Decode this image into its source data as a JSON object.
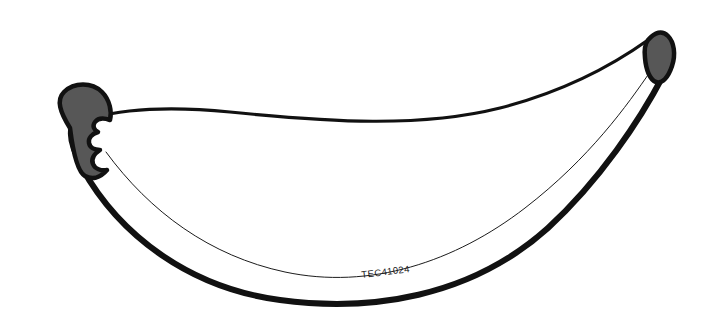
{
  "image": {
    "kind": "line-art-illustration",
    "subject": "banana",
    "title": "Banana outline drawing",
    "width": 705,
    "height": 319,
    "background_color": "#ffffff"
  },
  "label": {
    "text": "TEC41024",
    "x": 386,
    "y": 275,
    "rotation_deg": -7,
    "color": "#1a1a1a",
    "font_size": 9.5
  },
  "colors": {
    "outline": "#111111",
    "tip_fill": "#575757",
    "body_fill": "#ffffff",
    "inner_line": "#1c1c1c",
    "background": "#ffffff"
  },
  "strokes": {
    "top_outline_width": 3.2,
    "bottom_outline_width": 6.0,
    "right_edge_width": 7.0,
    "inner_line_width": 1.0,
    "tip_outline_width": 4.5
  },
  "shapes": {
    "body": {
      "name": "banana-body",
      "description": "Crescent shaped banana body outlined in black with white interior",
      "path": "M 70 128 C 95 112 150 104 230 112 C 330 122 420 128 500 108 C 570 90 620 60 648 40 C 660 50 666 62 663 76 C 640 120 600 180 548 228 C 470 298 370 312 280 300 C 190 288 120 236 82 168 C 72 152 68 138 70 128 Z"
    },
    "left_tip": {
      "name": "banana-left-tip",
      "description": "Blunt gray-filled left stem end with three scalloped lobes on its inner edge",
      "fill": "#575757",
      "path": "M 70 128 C 60 112 56 100 64 92 C 74 82 92 82 102 92 C 110 100 112 112 110 120 C 104 118 98 118 95 122 C 92 126 94 130 98 132 C 92 134 88 138 89 143 C 90 148 95 150 100 150 C 94 154 91 159 93 164 C 95 169 101 171 107 170 C 100 178 92 180 85 176 C 78 172 73 152 70 128 Z"
    },
    "right_tip": {
      "name": "banana-right-tip",
      "description": "Small pointed gray-filled right tip cap",
      "fill": "#575757",
      "path": "M 648 40 C 655 32 662 30 668 36 C 674 42 676 54 672 66 C 668 78 662 84 656 82 C 650 80 646 70 645 58 C 644 50 645 44 648 40 Z"
    },
    "inner_curve": {
      "name": "banana-inner-contour-line",
      "description": "Thin hairline contour following the inside of the lower banana edge",
      "path": "M 106 152 C 150 212 210 256 285 272 C 370 290 455 262 525 208 C 590 158 628 104 650 72"
    }
  },
  "accessibility": {
    "alt": "Black and white line drawing of a banana with dark gray tips, labeled TEC41024"
  }
}
